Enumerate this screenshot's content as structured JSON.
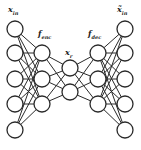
{
  "diagram": {
    "type": "autoencoder",
    "labels": {
      "input": {
        "main": "x",
        "sub": "in"
      },
      "output": {
        "main": "x̃",
        "sub": "in"
      },
      "encoder": {
        "main": "f",
        "sub": "enc"
      },
      "decoder": {
        "main": "f",
        "sub": "dec"
      },
      "latent": {
        "main": "x",
        "sub": "r"
      }
    },
    "layers": [
      {
        "name": "input",
        "x": 15,
        "nodes": [
          29,
          53,
          79,
          104,
          130
        ]
      },
      {
        "name": "encoder-hidden",
        "x": 42,
        "nodes": [
          53,
          79,
          104
        ]
      },
      {
        "name": "latent",
        "x": 70,
        "nodes": [
          68,
          92
        ]
      },
      {
        "name": "decoder-hidden",
        "x": 98,
        "nodes": [
          53,
          79,
          104
        ]
      },
      {
        "name": "output",
        "x": 125,
        "nodes": [
          29,
          53,
          79,
          104,
          130
        ]
      }
    ],
    "node_radius": 8,
    "colors": {
      "stroke": "#2a2a2a",
      "fill": "#ffffff"
    }
  }
}
